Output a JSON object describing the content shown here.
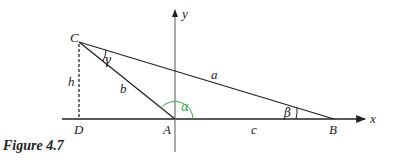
{
  "figure": {
    "caption": "Figure 4.7",
    "axes": {
      "x_label": "x",
      "y_label": "y"
    },
    "points": {
      "A": "A",
      "B": "B",
      "C": "C",
      "D": "D"
    },
    "sides": {
      "a": "a",
      "b": "b",
      "c": "c"
    },
    "height_label": "h",
    "angles": {
      "alpha": "α",
      "beta": "β",
      "gamma": "γ"
    },
    "colors": {
      "stroke": "#222222",
      "alpha_arc": "#3aa84a",
      "background": "#ffffff"
    }
  }
}
